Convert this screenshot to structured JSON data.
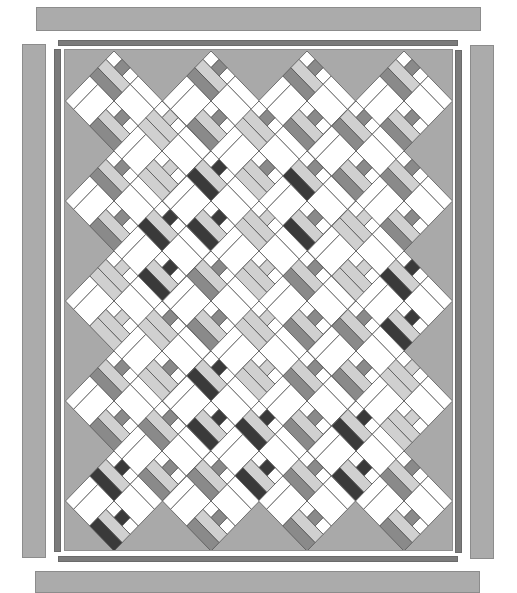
{
  "colors": {
    "background": "#a9a9a9",
    "outer_border": "#ababab",
    "inner_border": "#7b7b7b",
    "white": "#ffffff",
    "light": "#d0d0d0",
    "mid": "#8a8a8a",
    "dark": "#3a3a3a",
    "outline": "#555555"
  },
  "borders": {
    "outer_top": {
      "x": 36,
      "y": 7,
      "w": 445,
      "h": 24
    },
    "outer_bottom": {
      "x": 35,
      "y": 571,
      "w": 445,
      "h": 22
    },
    "outer_left": {
      "x": 22,
      "y": 44,
      "w": 24,
      "h": 514
    },
    "outer_right": {
      "x": 470,
      "y": 45,
      "w": 24,
      "h": 514
    },
    "thin_top": {
      "x": 58,
      "y": 40,
      "w": 400,
      "h": 6
    },
    "thin_bottom": {
      "x": 58,
      "y": 556,
      "w": 400,
      "h": 6
    },
    "thin_left": {
      "x": 54,
      "y": 49,
      "w": 7,
      "h": 503
    },
    "thin_right": {
      "x": 455,
      "y": 50,
      "w": 7,
      "h": 503
    }
  },
  "block": {
    "grid_units": 6,
    "half_width": 48.5,
    "half_height": 50
  },
  "blocks": [
    {
      "cx": 49,
      "cy": 51,
      "tone": "mid",
      "accent": "mid"
    },
    {
      "cx": 146,
      "cy": 51,
      "tone": "mid",
      "accent": "mid"
    },
    {
      "cx": 242,
      "cy": 51,
      "tone": "mid",
      "accent": "mid"
    },
    {
      "cx": 339,
      "cy": 51,
      "tone": "mid",
      "accent": "mid"
    },
    {
      "cx": 97,
      "cy": 101,
      "tone": "light",
      "accent": "light"
    },
    {
      "cx": 194,
      "cy": 101,
      "tone": "light",
      "accent": "mid"
    },
    {
      "cx": 291,
      "cy": 101,
      "tone": "mid",
      "accent": "mid"
    },
    {
      "cx": 49,
      "cy": 151,
      "tone": "mid",
      "accent": "mid"
    },
    {
      "cx": 146,
      "cy": 151,
      "tone": "dark",
      "accent": "dark"
    },
    {
      "cx": 242,
      "cy": 151,
      "tone": "dark",
      "accent": "mid"
    },
    {
      "cx": 339,
      "cy": 151,
      "tone": "mid",
      "accent": "mid"
    },
    {
      "cx": 97,
      "cy": 201,
      "tone": "dark",
      "accent": "dark"
    },
    {
      "cx": 194,
      "cy": 201,
      "tone": "light",
      "accent": "light"
    },
    {
      "cx": 291,
      "cy": 201,
      "tone": "light",
      "accent": "light"
    },
    {
      "cx": 49,
      "cy": 251,
      "tone": "light",
      "accent": "light"
    },
    {
      "cx": 146,
      "cy": 251,
      "tone": "mid",
      "accent": "mid"
    },
    {
      "cx": 242,
      "cy": 251,
      "tone": "mid",
      "accent": "mid"
    },
    {
      "cx": 339,
      "cy": 251,
      "tone": "dark",
      "accent": "dark"
    },
    {
      "cx": 97,
      "cy": 301,
      "tone": "light",
      "accent": "mid"
    },
    {
      "cx": 194,
      "cy": 301,
      "tone": "light",
      "accent": "light"
    },
    {
      "cx": 291,
      "cy": 301,
      "tone": "mid",
      "accent": "mid"
    },
    {
      "cx": 49,
      "cy": 351,
      "tone": "mid",
      "accent": "mid"
    },
    {
      "cx": 146,
      "cy": 351,
      "tone": "dark",
      "accent": "dark"
    },
    {
      "cx": 242,
      "cy": 351,
      "tone": "mid",
      "accent": "mid"
    },
    {
      "cx": 339,
      "cy": 351,
      "tone": "light",
      "accent": "light"
    },
    {
      "cx": 97,
      "cy": 401,
      "tone": "mid",
      "accent": "mid"
    },
    {
      "cx": 194,
      "cy": 401,
      "tone": "dark",
      "accent": "dark"
    },
    {
      "cx": 291,
      "cy": 401,
      "tone": "dark",
      "accent": "dark"
    },
    {
      "cx": 49,
      "cy": 451,
      "tone": "dark",
      "accent": "dark"
    },
    {
      "cx": 146,
      "cy": 451,
      "tone": "mid",
      "accent": "mid"
    },
    {
      "cx": 242,
      "cy": 451,
      "tone": "mid",
      "accent": "mid"
    },
    {
      "cx": 339,
      "cy": 451,
      "tone": "mid",
      "accent": "mid"
    }
  ]
}
